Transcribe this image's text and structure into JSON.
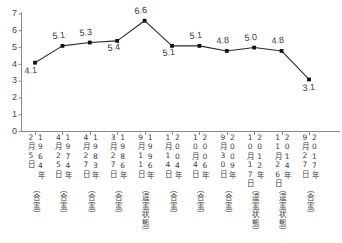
{
  "chart_data": {
    "type": "line",
    "title": "",
    "subtitle": "",
    "xlabel": "",
    "ylabel": "",
    "ylim": [
      0,
      7
    ],
    "yticks": [
      0,
      1,
      2,
      3,
      4,
      5,
      6,
      7
    ],
    "grid": false,
    "legend": false,
    "marker": "square",
    "line_color": "#2b2b2b",
    "marker_color": "#111111",
    "axis_color": "#8a8a8a",
    "categories": [
      "1964年2月5日（合憲）",
      "1974年4月25日（合憲）",
      "1983年4月27日（合憲）",
      "1986年3月27日（合憲）",
      "1996年9月11日（違憲状態）",
      "2004年1月14日（合憲）",
      "2006年10月4日（合憲）",
      "2009年9月30日（合憲）",
      "2012年10月17日（違憲状態）",
      "2014年11月26日（違憲状態）",
      "2017年9月27日（合憲）"
    ],
    "values": [
      4.1,
      5.1,
      5.3,
      5.4,
      6.6,
      5.1,
      5.1,
      4.8,
      5.0,
      4.8,
      3.1
    ],
    "value_labels": [
      "4.1",
      "5.1",
      "5.3",
      "5.4",
      "6.6",
      "5.1",
      "5.1",
      "4.8",
      "5.0",
      "4.8",
      "3.1"
    ],
    "points": [
      {
        "year": "1964年",
        "date": "2月5日",
        "ruling": "（合憲）",
        "value": 4.1,
        "label": "4.1",
        "label_pos": "below"
      },
      {
        "year": "1974年",
        "date": "4月25日",
        "ruling": "（合憲）",
        "value": 5.1,
        "label": "5.1",
        "label_pos": "above"
      },
      {
        "year": "1983年",
        "date": "4月27日",
        "ruling": "（合憲）",
        "value": 5.3,
        "label": "5.3",
        "label_pos": "above"
      },
      {
        "year": "1986年",
        "date": "3月27日",
        "ruling": "（合憲）",
        "value": 5.4,
        "label": "5.4",
        "label_pos": "below"
      },
      {
        "year": "1996年",
        "date": "9月11日",
        "ruling": "（違憲状態）",
        "value": 6.6,
        "label": "6.6",
        "label_pos": "above"
      },
      {
        "year": "2004年",
        "date": "1月14日",
        "ruling": "（合憲）",
        "value": 5.1,
        "label": "5.1",
        "label_pos": "below"
      },
      {
        "year": "2006年",
        "date": "10月4日",
        "ruling": "（合憲）",
        "value": 5.1,
        "label": "5.1",
        "label_pos": "above"
      },
      {
        "year": "2009年",
        "date": "9月30日",
        "ruling": "（合憲）",
        "value": 4.8,
        "label": "4.8",
        "label_pos": "above"
      },
      {
        "year": "2012年",
        "date": "10月17日",
        "ruling": "（違憲状態）",
        "value": 5.0,
        "label": "5.0",
        "label_pos": "above"
      },
      {
        "year": "2014年",
        "date": "11月26日",
        "ruling": "（違憲状態）",
        "value": 4.8,
        "label": "4.8",
        "label_pos": "above"
      },
      {
        "year": "2017年",
        "date": "9月27日",
        "ruling": "（合憲）",
        "value": 3.1,
        "label": "3.1",
        "label_pos": "below"
      }
    ]
  }
}
